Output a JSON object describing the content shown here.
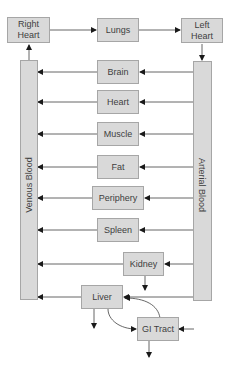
{
  "diagram": {
    "type": "physiologically-based pharmacokinetic model",
    "top_row": {
      "right_heart": "Right\nHeart",
      "lungs": "Lungs",
      "left_heart": "Left\nHeart"
    },
    "bars": {
      "venous": "Venous Blood",
      "arterial": "Arterial Blood"
    },
    "organs": [
      "Brain",
      "Heart",
      "Muscle",
      "Fat",
      "Periphery",
      "Spleen",
      "Kidney",
      "Liver",
      "GI Tract"
    ],
    "colors": {
      "box_fill": "#d9d9d9",
      "box_border": "#a6a6a6",
      "text": "#404040",
      "line": "#404040"
    }
  }
}
